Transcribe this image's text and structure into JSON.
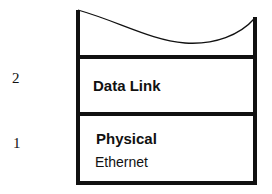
{
  "diagram": {
    "type": "protocol-stack",
    "layers": [
      {
        "number": "2",
        "name": "Data Link",
        "detail": ""
      },
      {
        "number": "1",
        "name": "Physical",
        "detail": "Ethernet"
      }
    ],
    "colors": {
      "line": "#111111",
      "background": "#ffffff"
    }
  }
}
